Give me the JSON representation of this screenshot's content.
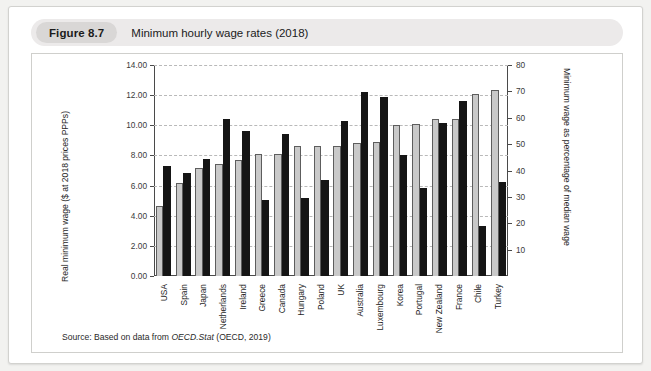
{
  "figure": {
    "badge": "Figure 8.7",
    "title": "Minimum hourly wage rates (2018)"
  },
  "source": {
    "prefix": "Source:",
    "text_before": " Based on data from ",
    "italic": "OECD.Stat",
    "text_after": " (OECD, 2019)"
  },
  "colors": {
    "wage_bar": "#151515",
    "pct_bar": "#c9c9c9",
    "axis": "#4a4a4a",
    "grid": "#b9b9b9",
    "header_band": "#eceaea",
    "badge": "#d9d7d6",
    "page_background": "#f2f2f0"
  },
  "chart_data": {
    "type": "bar",
    "title": "Minimum hourly wage rates (2018)",
    "xlabel": "",
    "ylabel": "Real minimum wage ($ at 2018 prices PPPs)",
    "y2label": "Minimum wage as percentage of median wage",
    "ylim": [
      0,
      14
    ],
    "ytick_labels": [
      "0.00",
      "2.00",
      "4.00",
      "6.00",
      "8.00",
      "10.00",
      "12.00",
      "14.00"
    ],
    "ytick_values": [
      0,
      2,
      4,
      6,
      8,
      10,
      12,
      14
    ],
    "y2lim": [
      0,
      80
    ],
    "y2tick_labels": [
      "10",
      "20",
      "30",
      "40",
      "50",
      "60",
      "70",
      "80"
    ],
    "y2tick_values": [
      10,
      20,
      30,
      40,
      50,
      60,
      70,
      80
    ],
    "grid": true,
    "legend_position": "none",
    "categories": [
      "USA",
      "Spain",
      "Japan",
      "Netherlands",
      "Ireland",
      "Greece",
      "Canada",
      "Hungary",
      "Poland",
      "UK",
      "Australia",
      "Luxembourg",
      "Korea",
      "Portugal",
      "New Zealand",
      "France",
      "Chile",
      "Turkey"
    ],
    "series": [
      {
        "name": "Minimum wage as percentage of median wage",
        "axis": "right",
        "unit": "%",
        "values": [
          26,
          35,
          41,
          42,
          44,
          46,
          46,
          49,
          49,
          49,
          50,
          51,
          57,
          57,
          58,
          59,
          68,
          70
        ],
        "values_plot_scale": [
          4.65,
          6.2,
          7.2,
          7.4,
          7.7,
          8.1,
          8.1,
          8.6,
          8.6,
          8.65,
          8.85,
          8.9,
          10.0,
          10.1,
          10.45,
          10.45,
          12.1,
          12.35
        ]
      },
      {
        "name": "Real minimum wage ($ at 2018 prices PPPs)",
        "axis": "left",
        "unit": "$",
        "values": [
          7.3,
          6.85,
          7.75,
          10.4,
          9.6,
          5.05,
          9.45,
          5.2,
          6.4,
          10.3,
          12.2,
          11.9,
          8.05,
          5.85,
          10.15,
          11.6,
          3.3,
          6.25
        ]
      }
    ]
  }
}
